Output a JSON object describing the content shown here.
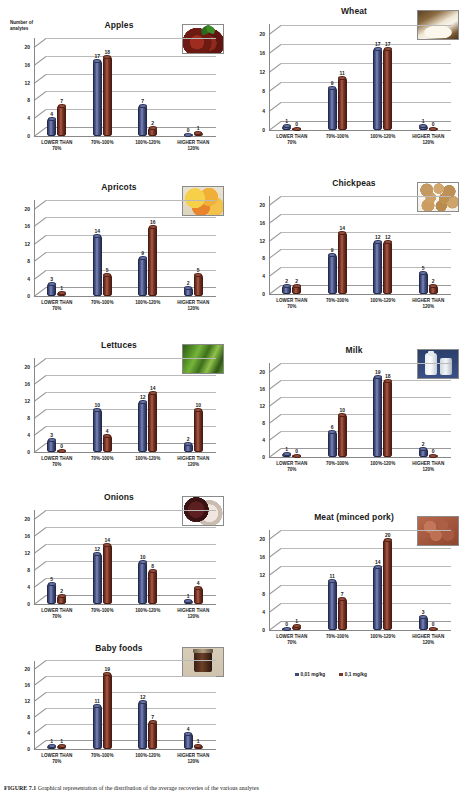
{
  "figure": {
    "caption_label": "FIGURE 7.1",
    "caption_text": "Graphical representation of the distribution of the average recoveries of the various analytes"
  },
  "axis": {
    "y_caption": "Number of\nanalytes",
    "y_ticks": [
      0,
      4,
      8,
      12,
      16,
      20
    ],
    "y_max": 22,
    "categories": [
      "LOWER THAN\n70%",
      "70%-100%",
      "100%-120%",
      "HIGHER THAN\n120%"
    ]
  },
  "legend": {
    "items": [
      {
        "label": "0,01 mg/kg",
        "color": "#3f4a7a",
        "name": "legend-blue"
      },
      {
        "label": "0,1 mg/kg",
        "color": "#7b3526",
        "name": "legend-red"
      }
    ]
  },
  "colors": {
    "series_blue": "#3f4a7a",
    "series_red": "#7b3526",
    "gridline": "#b9b9b9"
  },
  "chart_data": [
    {
      "id": "apples",
      "type": "bar",
      "title": "Apples",
      "xlabel": "",
      "ylabel": "Number of analytes",
      "ylim": [
        0,
        22
      ],
      "grid": true,
      "categories": [
        "LOWER THAN 70%",
        "70%-100%",
        "100%-120%",
        "HIGHER THAN 120%"
      ],
      "series": [
        {
          "name": "0,01 mg/kg",
          "values": [
            4,
            17,
            7,
            0
          ]
        },
        {
          "name": "0,1 mg/kg",
          "values": [
            7,
            18,
            2,
            1
          ]
        }
      ],
      "thumbnail": "apples-photo"
    },
    {
      "id": "wheat",
      "type": "bar",
      "title": "Wheat",
      "xlabel": "",
      "ylabel": "",
      "ylim": [
        0,
        22
      ],
      "grid": true,
      "categories": [
        "LOWER THAN 70%",
        "70%-100%",
        "100%-120%",
        "HIGHER THAN 120%"
      ],
      "series": [
        {
          "name": "0,01 mg/kg",
          "values": [
            1,
            9,
            17,
            1
          ]
        },
        {
          "name": "0,1 mg/kg",
          "values": [
            0,
            11,
            17,
            0
          ]
        }
      ],
      "thumbnail": "wheat-flour-photo"
    },
    {
      "id": "apricots",
      "type": "bar",
      "title": "Apricots",
      "xlabel": "",
      "ylabel": "",
      "ylim": [
        0,
        22
      ],
      "grid": true,
      "categories": [
        "LOWER THAN 70%",
        "70%-100%",
        "100%-120%",
        "HIGHER THAN 120%"
      ],
      "series": [
        {
          "name": "0,01 mg/kg",
          "values": [
            3,
            14,
            9,
            2
          ]
        },
        {
          "name": "0,1 mg/kg",
          "values": [
            1,
            5,
            16,
            5
          ]
        }
      ],
      "thumbnail": "apricots-photo"
    },
    {
      "id": "chickpeas",
      "type": "bar",
      "title": "Chickpeas",
      "xlabel": "",
      "ylabel": "",
      "ylim": [
        0,
        22
      ],
      "grid": true,
      "categories": [
        "LOWER THAN 70%",
        "70%-100%",
        "100%-120%",
        "HIGHER THAN 120%"
      ],
      "series": [
        {
          "name": "0,01 mg/kg",
          "values": [
            2,
            9,
            12,
            5
          ]
        },
        {
          "name": "0,1 mg/kg",
          "values": [
            2,
            14,
            12,
            2
          ]
        }
      ],
      "thumbnail": "chickpeas-photo"
    },
    {
      "id": "lettuces",
      "type": "bar",
      "title": "Lettuces",
      "xlabel": "",
      "ylabel": "",
      "ylim": [
        0,
        22
      ],
      "grid": true,
      "categories": [
        "LOWER THAN 70%",
        "70%-100%",
        "100%-120%",
        "HIGHER THAN 120%"
      ],
      "series": [
        {
          "name": "0,01 mg/kg",
          "values": [
            3,
            10,
            12,
            2
          ]
        },
        {
          "name": "0,1 mg/kg",
          "values": [
            0,
            4,
            14,
            10
          ]
        }
      ],
      "thumbnail": "lettuce-photo"
    },
    {
      "id": "milk",
      "type": "bar",
      "title": "Milk",
      "xlabel": "",
      "ylabel": "",
      "ylim": [
        0,
        22
      ],
      "grid": true,
      "categories": [
        "LOWER THAN 70%",
        "70%-100%",
        "100%-120%",
        "HIGHER THAN 120%"
      ],
      "series": [
        {
          "name": "0,01 mg/kg",
          "values": [
            1,
            6,
            19,
            2
          ]
        },
        {
          "name": "0,1 mg/kg",
          "values": [
            0,
            10,
            18,
            0
          ]
        }
      ],
      "thumbnail": "milk-photo"
    },
    {
      "id": "onions",
      "type": "bar",
      "title": "Onions",
      "xlabel": "",
      "ylabel": "",
      "ylim": [
        0,
        22
      ],
      "grid": true,
      "categories": [
        "LOWER THAN 70%",
        "70%-100%",
        "100%-120%",
        "HIGHER THAN 120%"
      ],
      "series": [
        {
          "name": "0,01 mg/kg",
          "values": [
            5,
            12,
            10,
            1
          ]
        },
        {
          "name": "0,1 mg/kg",
          "values": [
            2,
            14,
            8,
            4
          ]
        }
      ],
      "thumbnail": "onions-photo"
    },
    {
      "id": "meat",
      "type": "bar",
      "title": "Meat (minced pork)",
      "xlabel": "",
      "ylabel": "",
      "ylim": [
        0,
        22
      ],
      "grid": true,
      "categories": [
        "LOWER THAN 70%",
        "70%-100%",
        "100%-120%",
        "HIGHER THAN 120%"
      ],
      "series": [
        {
          "name": "0,01 mg/kg",
          "values": [
            0,
            11,
            14,
            3
          ]
        },
        {
          "name": "0,1 mg/kg",
          "values": [
            1,
            7,
            20,
            0
          ]
        }
      ],
      "thumbnail": "minced-pork-photo"
    },
    {
      "id": "babyfoods",
      "type": "bar",
      "title": "Baby foods",
      "xlabel": "",
      "ylabel": "",
      "ylim": [
        0,
        22
      ],
      "grid": true,
      "categories": [
        "LOWER THAN 70%",
        "70%-100%",
        "100%-120%",
        "HIGHER THAN 120%"
      ],
      "series": [
        {
          "name": "0,01 mg/kg",
          "values": [
            1,
            11,
            12,
            4
          ]
        },
        {
          "name": "0,1 mg/kg",
          "values": [
            1,
            19,
            7,
            1
          ]
        }
      ],
      "thumbnail": "baby-food-jar-photo"
    }
  ],
  "layout": {
    "panels": [
      {
        "id": "apples",
        "x": 8,
        "y": 20,
        "w": 222,
        "h": 150
      },
      {
        "id": "wheat",
        "x": 243,
        "y": 6,
        "w": 222,
        "h": 158
      },
      {
        "id": "apricots",
        "x": 8,
        "y": 182,
        "w": 222,
        "h": 148
      },
      {
        "id": "chickpeas",
        "x": 243,
        "y": 178,
        "w": 222,
        "h": 150
      },
      {
        "id": "lettuces",
        "x": 8,
        "y": 340,
        "w": 222,
        "h": 146
      },
      {
        "id": "milk",
        "x": 243,
        "y": 345,
        "w": 222,
        "h": 146
      },
      {
        "id": "onions",
        "x": 8,
        "y": 492,
        "w": 222,
        "h": 146
      },
      {
        "id": "meat",
        "x": 243,
        "y": 512,
        "w": 222,
        "h": 152
      },
      {
        "id": "babyfoods",
        "x": 8,
        "y": 643,
        "w": 222,
        "h": 140
      }
    ]
  }
}
